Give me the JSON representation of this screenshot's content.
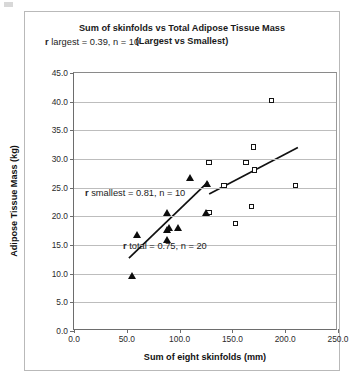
{
  "chart_data": {
    "type": "scatter",
    "title": "Sum of skinfolds vs Total Adipose Tissue Mass",
    "subtitle": "(Largest vs Smallest)",
    "xlabel": "Sum of eight skinfolds (mm)",
    "ylabel": "Adipose Tissue Mass (kg)",
    "xlim": [
      0,
      250
    ],
    "ylim": [
      0,
      45
    ],
    "xticks": [
      "0.0",
      "50.0",
      "100.0",
      "150.0",
      "200.0",
      "250.0"
    ],
    "xtick_values": [
      0,
      50,
      100,
      150,
      200,
      250
    ],
    "yticks": [
      "0.0",
      "5.0",
      "10.0",
      "15.0",
      "20.0",
      "25.0",
      "30.0",
      "35.0",
      "40.0",
      "45.0"
    ],
    "ytick_values": [
      0,
      5,
      10,
      15,
      20,
      25,
      30,
      35,
      40,
      45
    ],
    "grid": "horizontal",
    "legend": "none",
    "series": [
      {
        "name": "Largest",
        "marker": "open-square",
        "color": "#141414",
        "n": 10,
        "points": [
          [
            128,
            29.4
          ],
          [
            142,
            25.4
          ],
          [
            128,
            20.7
          ],
          [
            153,
            18.8
          ],
          [
            163,
            29.4
          ],
          [
            168,
            21.7
          ],
          [
            170,
            32.1
          ],
          [
            171,
            28.1
          ],
          [
            187,
            40.2
          ],
          [
            210,
            25.4
          ]
        ]
      },
      {
        "name": "Smallest",
        "marker": "filled-triangle",
        "color": "#0d0d0d",
        "n": 10,
        "points": [
          [
            55,
            9.7
          ],
          [
            60,
            16.8
          ],
          [
            88,
            16.0
          ],
          [
            88,
            17.6
          ],
          [
            88,
            20.6
          ],
          [
            90,
            18.0
          ],
          [
            99,
            18.0
          ],
          [
            110,
            26.8
          ],
          [
            125,
            20.7
          ],
          [
            126,
            25.7
          ]
        ]
      }
    ],
    "fit_lines": [
      {
        "name": "smallest-trendline",
        "x": [
          52,
          127
        ],
        "y": [
          12.7,
          26.0
        ],
        "color": "#111111"
      },
      {
        "name": "largest-trendline",
        "x": [
          128,
          212
        ],
        "y": [
          23.9,
          32.0
        ],
        "color": "#111111"
      }
    ],
    "annotations": [
      {
        "id": "largest",
        "symbol": "r",
        "text": " largest = 0.39, n = 10"
      },
      {
        "id": "smallest",
        "symbol": "r",
        "text": " smallest = 0.81, n = 10"
      },
      {
        "id": "total",
        "symbol": "r",
        "text": " total = 0.75, n = 20"
      }
    ]
  }
}
